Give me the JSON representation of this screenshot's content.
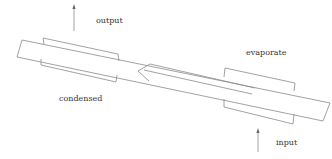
{
  "diagram": {
    "type": "heat-pipe schematic",
    "labels": {
      "output": "output",
      "evaporate": "evaporate",
      "condensed": "condensed",
      "input": "input"
    },
    "arrows": {
      "output": {
        "direction": "up",
        "meaning": "heat output at condenser end"
      },
      "input": {
        "direction": "up",
        "meaning": "heat input at evaporator end"
      },
      "internal_flow": {
        "direction": "left",
        "meaning": "vapor flows from evaporator to condenser"
      }
    },
    "colors": {
      "line": "#8a8a8a",
      "text": "#333333",
      "background": "#ffffff"
    }
  }
}
